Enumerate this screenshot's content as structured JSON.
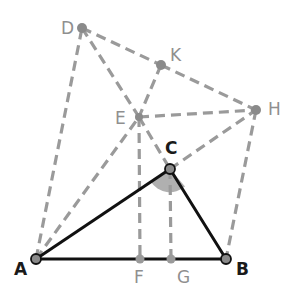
{
  "diagram": {
    "colors": {
      "solid": "#111111",
      "dashed": "#9a9a9a",
      "point_fill": "#8a8a8a",
      "angle_fill": "#a8a8a8",
      "label_dark": "#1a1a1a",
      "label_gray": "#8f8f8f"
    },
    "points": {
      "A": {
        "label": "A",
        "x": 36,
        "y": 259
      },
      "B": {
        "label": "B",
        "x": 226,
        "y": 259
      },
      "C": {
        "label": "C",
        "x": 170,
        "y": 169
      },
      "D": {
        "label": "D",
        "x": 82,
        "y": 28
      },
      "E": {
        "label": "E",
        "x": 139,
        "y": 117
      },
      "F": {
        "label": "F",
        "x": 140,
        "y": 259
      },
      "G": {
        "label": "G",
        "x": 171,
        "y": 259
      },
      "H": {
        "label": "H",
        "x": 256,
        "y": 110
      },
      "K": {
        "label": "K",
        "x": 161,
        "y": 65
      }
    },
    "solid_segments": [
      [
        "A",
        "B"
      ],
      [
        "A",
        "C"
      ],
      [
        "C",
        "B"
      ]
    ],
    "dashed_segments": [
      [
        "A",
        "D"
      ],
      [
        "A",
        "E"
      ],
      [
        "D",
        "E"
      ],
      [
        "D",
        "K"
      ],
      [
        "K",
        "H"
      ],
      [
        "K",
        "E"
      ],
      [
        "E",
        "H"
      ],
      [
        "E",
        "C"
      ],
      [
        "E",
        "F"
      ],
      [
        "C",
        "G"
      ],
      [
        "C",
        "H"
      ],
      [
        "H",
        "B"
      ]
    ],
    "shaded_angle": {
      "vertex": "C",
      "between": [
        "A",
        "B"
      ]
    }
  }
}
